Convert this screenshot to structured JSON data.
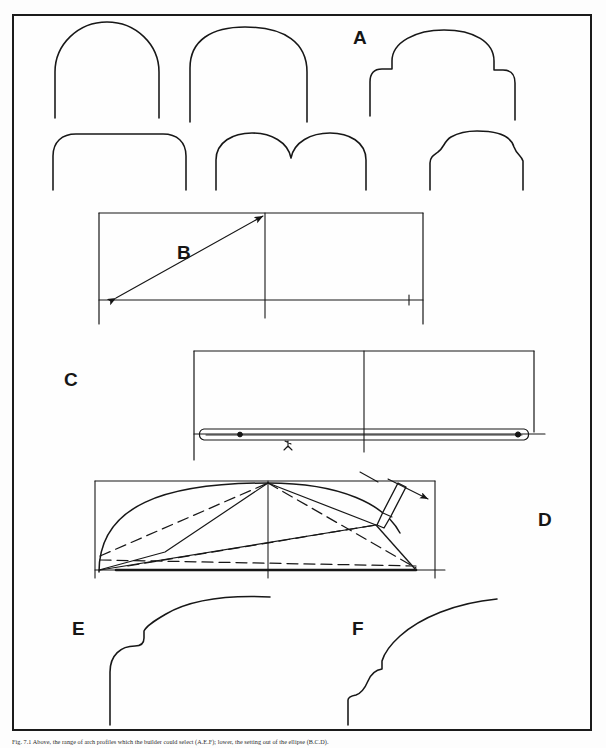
{
  "figure": {
    "panels": [
      {
        "key": "A",
        "label": "A",
        "description": "Row of six masonry arch head profiles: round arch, segmental-stilted arch, shouldered three-lobe arch, flat arch with rounded corners, twin-lobed cusped arch, and ogee-shouldered arch"
      },
      {
        "key": "B",
        "label": "B",
        "description": "Rectangle with vertical centre line and horizontal springing line; double headed arrow shows the half-span and rise diagonal"
      },
      {
        "key": "C",
        "label": "C",
        "description": "Rectangle with centre line and a long thin trammel rod laid on the springing line with two pin points marked"
      },
      {
        "key": "D",
        "label": "D",
        "description": "Rectangle with elliptical arc drawn by trammel; solid and dashed construction lines converge on a pencil held at the tracing point, arrow showing direction of travel"
      },
      {
        "key": "E",
        "label": "E",
        "description": "Arch profile with a square impost step and a flattened elliptical haunch"
      },
      {
        "key": "F",
        "label": "F",
        "description": "Arch profile with an ogee moulded impost step and a flattened elliptical haunch"
      }
    ],
    "caption_prefix": "Fig. 7.1",
    "caption": "Fig. 7.1 Above, the range of arch profiles which the builder could select (A.E.F); lower, the setting out of the ellipse (B.C.D)."
  }
}
